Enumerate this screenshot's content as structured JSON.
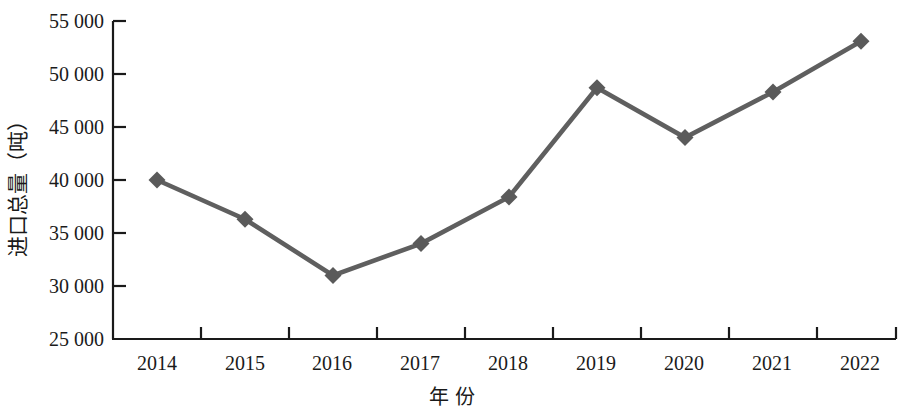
{
  "chart_data": {
    "type": "line",
    "title": "",
    "subtitle": "",
    "xlabel": "年 份",
    "ylabel": "进口总量（吨）",
    "categories": [
      "2014",
      "2015",
      "2016",
      "2017",
      "2018",
      "2019",
      "2020",
      "2021",
      "2022"
    ],
    "values": [
      40000,
      36300,
      31000,
      34000,
      38400,
      48700,
      44000,
      48300,
      53100
    ],
    "series": [
      {
        "name": "进口总量",
        "values": [
          40000,
          36300,
          31000,
          34000,
          38400,
          48700,
          44000,
          48300,
          53100
        ]
      }
    ],
    "ylim": [
      25000,
      55000
    ],
    "yticks": [
      25000,
      30000,
      35000,
      40000,
      45000,
      50000,
      55000
    ],
    "ytick_labels": [
      "25 000",
      "30 000",
      "35 000",
      "40 000",
      "45 000",
      "50 000",
      "55 000"
    ],
    "grid": false,
    "legend": "none",
    "marker": "diamond",
    "line_color": "#5f5f5f",
    "marker_color": "#5a5a5a",
    "axis_color": "#1a1a1a"
  }
}
